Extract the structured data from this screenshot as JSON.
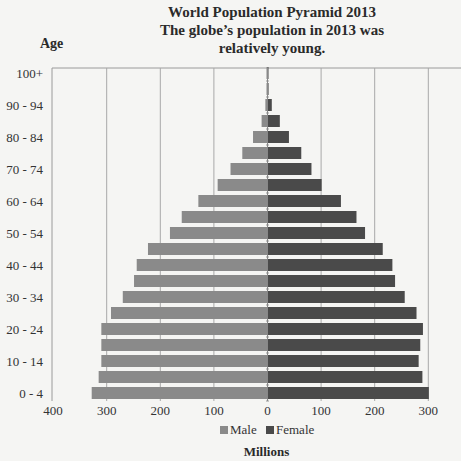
{
  "chart_data": {
    "type": "bar",
    "orientation": "horizontal",
    "subtype": "population-pyramid",
    "title": "World Population Pyramid 2013",
    "subtitle_lines": [
      "The globe’s population in 2013 was",
      "relatively young."
    ],
    "title_lines": [
      "World Population Pyramid 2013",
      "The globe’s population in 2013 was",
      "relatively young."
    ],
    "ylabel": "Age",
    "xlabel": "Millions",
    "categories": [
      "0 - 4",
      "5 - 9",
      "10 - 14",
      "15 - 19",
      "20 - 24",
      "25 - 29",
      "30 - 34",
      "35 - 39",
      "40 - 44",
      "45 - 49",
      "50 - 54",
      "55 - 59",
      "60 - 64",
      "65 - 69",
      "70 - 74",
      "75 - 79",
      "80 - 84",
      "85 - 89",
      "90 - 94",
      "95 - 99",
      "100+"
    ],
    "visible_category_labels": [
      "0 - 4",
      "10 - 14",
      "20 - 24",
      "30 - 34",
      "40 - 44",
      "50 - 54",
      "60 - 64",
      "70 - 74",
      "80 - 84",
      "90 - 94",
      "100+"
    ],
    "series": [
      {
        "name": "Male",
        "color": "#8a8a8a",
        "side": "left",
        "values": [
          328,
          315,
          310,
          310,
          310,
          292,
          270,
          249,
          244,
          223,
          182,
          160,
          129,
          93,
          69,
          47,
          27,
          11,
          4,
          0.5,
          0.3
        ]
      },
      {
        "name": "Female",
        "color": "#4a4a4a",
        "side": "right",
        "values": [
          301,
          289,
          282,
          285,
          290,
          278,
          256,
          238,
          233,
          215,
          182,
          166,
          137,
          101,
          82,
          63,
          40,
          23,
          8,
          2,
          0.5
        ]
      }
    ],
    "x_ticks": [
      {
        "label": "400",
        "value": -400
      },
      {
        "label": "300",
        "value": -300
      },
      {
        "label": "200",
        "value": -200
      },
      {
        "label": "100",
        "value": -100
      },
      {
        "label": "0",
        "value": 0
      },
      {
        "label": "100",
        "value": 100
      },
      {
        "label": "200",
        "value": 200
      },
      {
        "label": "300",
        "value": 300
      }
    ],
    "xlim": [
      -400,
      360
    ],
    "grid": {
      "vertical": true,
      "horizontal": false
    },
    "legend": {
      "position": "bottom",
      "entries": [
        "Male",
        "Female"
      ]
    }
  },
  "legend": {
    "male_label": "Male",
    "female_label": "Female"
  },
  "axis": {
    "y_title": "Age",
    "x_title": "Millions"
  }
}
